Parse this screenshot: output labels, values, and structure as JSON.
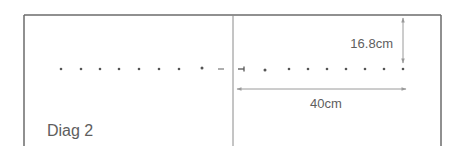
{
  "diagram": {
    "caption": "Diag 2",
    "dimensions": {
      "vertical": {
        "label": "16.8cm",
        "value": 16.8,
        "unit": "cm"
      },
      "horizontal": {
        "label": "40cm",
        "value": 40,
        "unit": "cm"
      }
    },
    "dots_left_count": 8,
    "dots_right_count": 8
  },
  "colors": {
    "border": "#6b6b6b",
    "divider": "#8a8a8a",
    "dot": "#555555",
    "arrow": "#9a9a9a",
    "text": "#5e5e5e"
  }
}
